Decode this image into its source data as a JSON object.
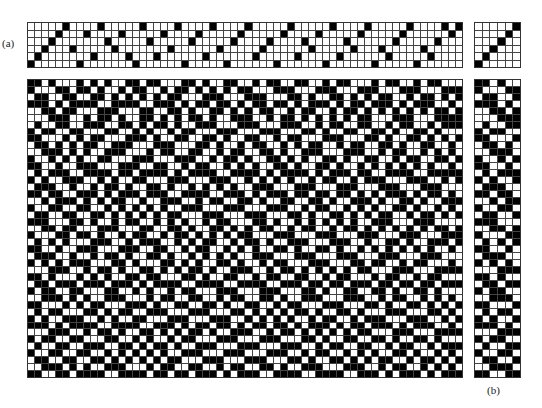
{
  "labels": {
    "a": "(a)",
    "b": "(b)"
  },
  "threading": {
    "shafts": 6,
    "ends": 62,
    "sequence": [
      1,
      2,
      3,
      4,
      5,
      6,
      3,
      1,
      5,
      2,
      6,
      4,
      3,
      5,
      2,
      1,
      6,
      4,
      2,
      5,
      3,
      6,
      1,
      4,
      5,
      2,
      6,
      3,
      1,
      4,
      5,
      6,
      2,
      3,
      4,
      1,
      5,
      6,
      2,
      4,
      3,
      5,
      1,
      6,
      2,
      4,
      3,
      5,
      6,
      1,
      3,
      2,
      4,
      5,
      6,
      1,
      3,
      2,
      4,
      6,
      5,
      6
    ]
  },
  "tieup": {
    "size": 6,
    "pattern": "diagonal"
  },
  "liftplan": {
    "shafts": 6,
    "picks": 43,
    "rows": [
      [
        1,
        1,
        0,
        1,
        0,
        0
      ],
      [
        1,
        0,
        0,
        0,
        1,
        1
      ],
      [
        0,
        1,
        1,
        0,
        0,
        1
      ],
      [
        1,
        1,
        1,
        0,
        1,
        0
      ],
      [
        0,
        0,
        1,
        1,
        0,
        1
      ],
      [
        0,
        0,
        0,
        1,
        1,
        1
      ],
      [
        0,
        1,
        0,
        0,
        1,
        1
      ],
      [
        1,
        0,
        1,
        1,
        0,
        0
      ],
      [
        1,
        1,
        0,
        0,
        0,
        1
      ],
      [
        0,
        1,
        1,
        0,
        1,
        0
      ],
      [
        0,
        0,
        1,
        1,
        1,
        0
      ],
      [
        1,
        0,
        0,
        1,
        0,
        1
      ],
      [
        1,
        1,
        0,
        0,
        1,
        0
      ],
      [
        0,
        1,
        0,
        1,
        1,
        1
      ],
      [
        1,
        0,
        1,
        0,
        0,
        1
      ],
      [
        0,
        1,
        1,
        1,
        0,
        0
      ],
      [
        1,
        1,
        0,
        1,
        1,
        0
      ],
      [
        0,
        0,
        1,
        0,
        1,
        1
      ],
      [
        1,
        0,
        0,
        1,
        1,
        0
      ],
      [
        0,
        1,
        1,
        0,
        0,
        1
      ],
      [
        1,
        1,
        1,
        0,
        0,
        0
      ],
      [
        0,
        0,
        1,
        1,
        0,
        1
      ],
      [
        1,
        0,
        0,
        0,
        1,
        1
      ],
      [
        0,
        1,
        0,
        1,
        0,
        1
      ],
      [
        1,
        1,
        0,
        0,
        1,
        0
      ],
      [
        0,
        1,
        1,
        1,
        0,
        0
      ],
      [
        1,
        0,
        1,
        0,
        1,
        0
      ],
      [
        0,
        0,
        0,
        1,
        1,
        1
      ],
      [
        1,
        1,
        0,
        1,
        0,
        0
      ],
      [
        0,
        1,
        1,
        0,
        1,
        1
      ],
      [
        1,
        0,
        1,
        1,
        0,
        0
      ],
      [
        0,
        0,
        1,
        1,
        1,
        0
      ],
      [
        1,
        1,
        0,
        0,
        0,
        1
      ],
      [
        0,
        1,
        0,
        1,
        1,
        0
      ],
      [
        1,
        0,
        1,
        0,
        0,
        1
      ],
      [
        1,
        1,
        1,
        0,
        1,
        0
      ],
      [
        0,
        0,
        0,
        1,
        1,
        1
      ],
      [
        1,
        0,
        1,
        1,
        0,
        0
      ],
      [
        0,
        1,
        0,
        0,
        1,
        1
      ],
      [
        1,
        0,
        0,
        1,
        1,
        0
      ],
      [
        0,
        1,
        1,
        0,
        0,
        1
      ],
      [
        0,
        0,
        1,
        1,
        1,
        0
      ],
      [
        1,
        1,
        0,
        0,
        1,
        1
      ]
    ]
  },
  "colors": {
    "filled": "#000000",
    "empty": "#ffffff",
    "gridline": "#444444"
  }
}
